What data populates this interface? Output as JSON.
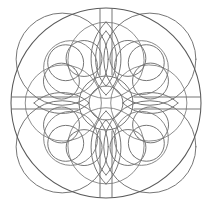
{
  "artwork": {
    "title": "Mandala Coloring Page",
    "subject": "circular celtic-knot mandala",
    "style": "line art / coloring page",
    "background_color": "#ffffff",
    "line_color": "#6f6f6f",
    "rim_color": "#5a5a5a",
    "line_width": 1,
    "canvas": {
      "width": 213,
      "height": 208
    }
  },
  "geometry": {
    "center": {
      "x": 106,
      "y": 103
    },
    "outer_circle": {
      "radius": 95,
      "label": "outer-rim"
    },
    "hub_outer_circle": {
      "radius": 27,
      "label": "hub-outer-ring"
    },
    "hub_inner_circle": {
      "radius": 17,
      "label": "hub-inner-ring"
    },
    "symmetry": {
      "fold": 4,
      "axes": [
        "vertical",
        "horizontal",
        "diagonal-nw-se",
        "diagonal-ne-sw"
      ]
    },
    "spokes": {
      "count": 4,
      "angles_deg": [
        0,
        90,
        180,
        270
      ],
      "half_width": 6,
      "inner_radius": 28,
      "outer_radius": 95
    },
    "axial_petals": {
      "count": 4,
      "angles_deg": [
        0,
        90,
        180,
        270
      ],
      "center_radius": 57,
      "petal_radius": 34
    },
    "diagonal_knots": {
      "count": 4,
      "angles_deg": [
        45,
        135,
        225,
        315
      ],
      "center_radius": 57,
      "lobe_radius": 30,
      "lobe_offset": 18
    },
    "big_arc_ring": {
      "count": 4,
      "angles_deg": [
        45,
        135,
        225,
        315
      ],
      "radius": 64,
      "center_radius": 62
    }
  },
  "palette": {
    "stroke": "#6f6f6f",
    "rim": "#5a5a5a",
    "thin": "#7b7b7b",
    "background": "#ffffff"
  }
}
